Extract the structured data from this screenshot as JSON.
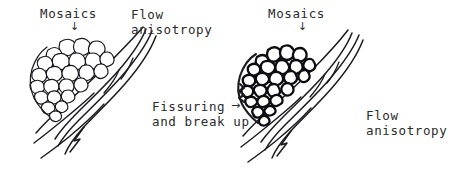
{
  "figure": {
    "width": 471,
    "height": 175,
    "background_color": "#ffffff",
    "ink_color": "#1c1c20",
    "text_color": "#2b2b2b"
  },
  "left_panel": {
    "name": "intact-mosaics-panel",
    "mosaics_label": "Mosaics",
    "mosaics_pointer": "↓",
    "flow_label_line1": "Flow",
    "flow_label_line2": "anisotropy",
    "description": "Cluster of intact rounded polygonal mosaic cells resting on diagonal flow laminae"
  },
  "transition": {
    "name": "fissuring-transition",
    "caption_line1": "Fissuring",
    "caption_line2": "and break up",
    "arrow": "→"
  },
  "right_panel": {
    "name": "broken-mosaics-panel",
    "mosaics_label": "Mosaics",
    "mosaics_pointer": "↓",
    "flow_label_line1": "Flow",
    "flow_label_line2": "anisotropy",
    "description": "Same mosaic cluster after fissuring: fragmented angular pieces with heavy dark outlines"
  }
}
